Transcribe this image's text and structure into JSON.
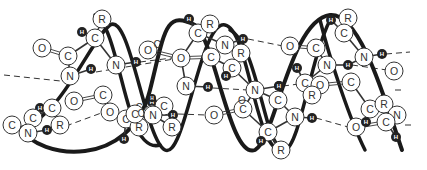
{
  "diagram": {
    "type": "alpha-helix-structure",
    "colors": {
      "background": "#ffffff",
      "backbone": "#1a1a1a",
      "atom_fill": "#ffffff",
      "atom_stroke": "#333333",
      "hydrogen_fill": "#222222",
      "hydrogen_text": "#ffffff",
      "bond": "#333333",
      "hbond": "#333333"
    },
    "backbone_paths": [
      "M 20 128 C 40 160, 130 170, 150 90 C 165 30, 165 10, 195 25 C 215 40, 230 160, 255 150 C 275 140, 290 20, 330 15 C 360 12, 385 100, 402 150",
      "M 20 128 C 60 120, 90 40, 110 25 C 130 12, 145 140, 165 150 C 185 160, 200 20, 225 25 C 250 30, 255 160, 285 150 C 300 145, 310 60, 330 20",
      "M 95 15 C 110 20, 120 80, 130 110 C 138 140, 150 148, 160 145",
      "M 230 30 C 250 40, 260 100, 270 130 C 275 145, 280 148, 285 150",
      "M 320 20 C 330 60, 350 120, 365 150"
    ],
    "atoms": [
      {
        "id": "o1",
        "label": "O",
        "x": 42,
        "y": 48,
        "r": 9
      },
      {
        "id": "c1",
        "label": "C",
        "x": 68,
        "y": 56,
        "r": 9
      },
      {
        "id": "n1",
        "label": "N",
        "x": 70,
        "y": 76,
        "r": 9
      },
      {
        "id": "h1",
        "label": "H",
        "x": 91,
        "y": 69,
        "r": 5,
        "hydrogen": true
      },
      {
        "id": "r1",
        "label": "R",
        "x": 102,
        "y": 19,
        "r": 9
      },
      {
        "id": "h2",
        "label": "H",
        "x": 82,
        "y": 32,
        "r": 5,
        "hydrogen": true
      },
      {
        "id": "c2",
        "label": "C",
        "x": 95,
        "y": 38,
        "r": 9
      },
      {
        "id": "n2",
        "label": "N",
        "x": 116,
        "y": 65,
        "r": 9
      },
      {
        "id": "h3",
        "label": "H",
        "x": 136,
        "y": 62,
        "r": 5,
        "hydrogen": true
      },
      {
        "id": "o2",
        "label": "O",
        "x": 148,
        "y": 50,
        "r": 9
      },
      {
        "id": "c3",
        "label": "C",
        "x": 157,
        "y": 44,
        "r": 0,
        "plain": true
      },
      {
        "id": "o3",
        "label": "O",
        "x": 181,
        "y": 58,
        "r": 9
      },
      {
        "id": "h4",
        "label": "H",
        "x": 189,
        "y": 19,
        "r": 5,
        "hydrogen": true
      },
      {
        "id": "c4",
        "label": "C",
        "x": 198,
        "y": 33,
        "r": 9
      },
      {
        "id": "r2",
        "label": "R",
        "x": 210,
        "y": 24,
        "r": 9
      },
      {
        "id": "n3",
        "label": "N",
        "x": 225,
        "y": 45,
        "r": 9
      },
      {
        "id": "h5",
        "label": "H",
        "x": 243,
        "y": 39,
        "r": 5,
        "hydrogen": true
      },
      {
        "id": "c5",
        "label": "C",
        "x": 211,
        "y": 57,
        "r": 9
      },
      {
        "id": "r3",
        "label": "R",
        "x": 241,
        "y": 53,
        "r": 9
      },
      {
        "id": "c6",
        "label": "C",
        "x": 232,
        "y": 68,
        "r": 9
      },
      {
        "id": "h6",
        "label": "H",
        "x": 226,
        "y": 76,
        "r": 5,
        "hydrogen": true
      },
      {
        "id": "n4",
        "label": "N",
        "x": 186,
        "y": 86,
        "r": 9
      },
      {
        "id": "h7",
        "label": "H",
        "x": 208,
        "y": 87,
        "r": 5,
        "hydrogen": true
      },
      {
        "id": "c7",
        "label": "C",
        "x": 12,
        "y": 125,
        "r": 9
      },
      {
        "id": "o4",
        "label": "O",
        "x": 74,
        "y": 101,
        "r": 9
      },
      {
        "id": "c8",
        "label": "C",
        "x": 103,
        "y": 95,
        "r": 9
      },
      {
        "id": "h8",
        "label": "H",
        "x": 40,
        "y": 108,
        "r": 5,
        "hydrogen": true
      },
      {
        "id": "c9",
        "label": "C",
        "x": 52,
        "y": 108,
        "r": 9
      },
      {
        "id": "c10",
        "label": "C",
        "x": 33,
        "y": 118,
        "r": 9
      },
      {
        "id": "n5",
        "label": "N",
        "x": 28,
        "y": 133,
        "r": 9
      },
      {
        "id": "h9",
        "label": "H",
        "x": 47,
        "y": 130,
        "r": 5,
        "hydrogen": true
      },
      {
        "id": "r4",
        "label": "R",
        "x": 60,
        "y": 125,
        "r": 9
      },
      {
        "id": "o5",
        "label": "O",
        "x": 110,
        "y": 112,
        "r": 9
      },
      {
        "id": "c11",
        "label": "C",
        "x": 126,
        "y": 119,
        "r": 9
      },
      {
        "id": "c12",
        "label": "C",
        "x": 139,
        "y": 107,
        "r": 0,
        "plain": true
      },
      {
        "id": "r5",
        "label": "R",
        "x": 139,
        "y": 127,
        "r": 9
      },
      {
        "id": "h10",
        "label": "H",
        "x": 124,
        "y": 139,
        "r": 5,
        "hydrogen": true
      },
      {
        "id": "h11",
        "label": "H",
        "x": 152,
        "y": 102,
        "r": 5,
        "hydrogen": true
      },
      {
        "id": "n6",
        "label": "N",
        "x": 152,
        "y": 114,
        "r": 9
      },
      {
        "id": "c13",
        "label": "C",
        "x": 135,
        "y": 114,
        "r": 9
      },
      {
        "id": "h12",
        "label": "H",
        "x": 152,
        "y": 98,
        "r": 4,
        "hydrogen": true
      },
      {
        "id": "c14",
        "label": "C",
        "x": 164,
        "y": 106,
        "r": 9
      },
      {
        "id": "c15",
        "label": "C",
        "x": 141,
        "y": 113,
        "r": 0,
        "plain": true
      },
      {
        "id": "n7",
        "label": "N",
        "x": 153,
        "y": 115,
        "r": 9
      },
      {
        "id": "h13",
        "label": "H",
        "x": 173,
        "y": 115,
        "r": 5,
        "hydrogen": true
      },
      {
        "id": "r6",
        "label": "R",
        "x": 172,
        "y": 127,
        "r": 9
      },
      {
        "id": "o6",
        "label": "O",
        "x": 214,
        "y": 115,
        "r": 9
      },
      {
        "id": "c16",
        "label": "C",
        "x": 243,
        "y": 109,
        "r": 9
      },
      {
        "id": "o7",
        "label": "O",
        "x": 242,
        "y": 100,
        "r": 0,
        "plain": true
      },
      {
        "id": "n8",
        "label": "N",
        "x": 255,
        "y": 90,
        "r": 9
      },
      {
        "id": "h14",
        "label": "H",
        "x": 279,
        "y": 86,
        "r": 5,
        "hydrogen": true
      },
      {
        "id": "c17",
        "label": "C",
        "x": 278,
        "y": 100,
        "r": 9
      },
      {
        "id": "c18",
        "label": "C",
        "x": 268,
        "y": 132,
        "r": 9
      },
      {
        "id": "h15",
        "label": "H",
        "x": 261,
        "y": 141,
        "r": 5,
        "hydrogen": true
      },
      {
        "id": "r7",
        "label": "R",
        "x": 281,
        "y": 150,
        "r": 9
      },
      {
        "id": "n9",
        "label": "N",
        "x": 295,
        "y": 117,
        "r": 9
      },
      {
        "id": "h16",
        "label": "H",
        "x": 312,
        "y": 118,
        "r": 5,
        "hydrogen": true
      },
      {
        "id": "o8",
        "label": "O",
        "x": 290,
        "y": 46,
        "r": 9
      },
      {
        "id": "c19",
        "label": "C",
        "x": 316,
        "y": 48,
        "r": 9
      },
      {
        "id": "h17",
        "label": "H",
        "x": 331,
        "y": 20,
        "r": 5,
        "hydrogen": true
      },
      {
        "id": "r8",
        "label": "R",
        "x": 348,
        "y": 18,
        "r": 9
      },
      {
        "id": "c20",
        "label": "C",
        "x": 344,
        "y": 33,
        "r": 9
      },
      {
        "id": "n10",
        "label": "N",
        "x": 327,
        "y": 65,
        "r": 9
      },
      {
        "id": "h18",
        "label": "H",
        "x": 348,
        "y": 65,
        "r": 5,
        "hydrogen": true
      },
      {
        "id": "n11",
        "label": "N",
        "x": 364,
        "y": 57,
        "r": 9
      },
      {
        "id": "h19",
        "label": "H",
        "x": 382,
        "y": 54,
        "r": 5,
        "hydrogen": true
      },
      {
        "id": "o9",
        "label": "O",
        "x": 394,
        "y": 71,
        "r": 9
      },
      {
        "id": "h20",
        "label": "H",
        "x": 297,
        "y": 68,
        "r": 5,
        "hydrogen": true
      },
      {
        "id": "c21",
        "label": "C",
        "x": 305,
        "y": 83,
        "r": 9
      },
      {
        "id": "o10",
        "label": "O",
        "x": 320,
        "y": 85,
        "r": 9
      },
      {
        "id": "r9",
        "label": "R",
        "x": 312,
        "y": 95,
        "r": 9
      },
      {
        "id": "c22",
        "label": "C",
        "x": 351,
        "y": 82,
        "r": 9
      },
      {
        "id": "h21",
        "label": "H",
        "x": 279,
        "y": 86,
        "r": 5,
        "hydrogen": true
      },
      {
        "id": "c23",
        "label": "C",
        "x": 370,
        "y": 109,
        "r": 9
      },
      {
        "id": "r10",
        "label": "R",
        "x": 384,
        "y": 104,
        "r": 9
      },
      {
        "id": "n12",
        "label": "N",
        "x": 397,
        "y": 115,
        "r": 9
      },
      {
        "id": "o11",
        "label": "O",
        "x": 356,
        "y": 127,
        "r": 9
      },
      {
        "id": "h22",
        "label": "H",
        "x": 366,
        "y": 122,
        "r": 5,
        "hydrogen": true
      },
      {
        "id": "c24",
        "label": "C",
        "x": 386,
        "y": 122,
        "r": 9
      },
      {
        "id": "h23",
        "label": "H",
        "x": 396,
        "y": 137,
        "r": 5,
        "hydrogen": true
      }
    ],
    "bonds": [
      [
        "o1",
        "c1",
        true
      ],
      [
        "c1",
        "n1",
        false
      ],
      [
        "n1",
        "h1",
        false
      ],
      [
        "c1",
        "c2",
        false
      ],
      [
        "c2",
        "r1",
        false
      ],
      [
        "c2",
        "h2",
        false
      ],
      [
        "c2",
        "n2",
        false
      ],
      [
        "n2",
        "h3",
        false
      ],
      [
        "o3",
        "c4",
        false
      ],
      [
        "c4",
        "h4",
        false
      ],
      [
        "c4",
        "r2",
        false
      ],
      [
        "c4",
        "n3",
        false
      ],
      [
        "n3",
        "h5",
        false
      ],
      [
        "o3",
        "c5",
        true
      ],
      [
        "c5",
        "n3",
        false
      ],
      [
        "c5",
        "c6",
        false
      ],
      [
        "c6",
        "r3",
        false
      ],
      [
        "c6",
        "h6",
        false
      ],
      [
        "c6",
        "n8",
        false
      ],
      [
        "n4",
        "h7",
        false
      ],
      [
        "o2",
        "o3",
        true
      ],
      [
        "n4",
        "o3",
        false
      ],
      [
        "o4",
        "c8",
        true
      ],
      [
        "c8",
        "o5",
        false
      ],
      [
        "o5",
        "c11",
        false
      ],
      [
        "c11",
        "r5",
        false
      ],
      [
        "c11",
        "h10",
        false
      ],
      [
        "c11",
        "n6",
        false
      ],
      [
        "n6",
        "h11",
        false
      ],
      [
        "c9",
        "c10",
        false
      ],
      [
        "c10",
        "n5",
        false
      ],
      [
        "n5",
        "h9",
        false
      ],
      [
        "h9",
        "r4",
        false
      ],
      [
        "c9",
        "r4",
        false
      ],
      [
        "c9",
        "h8",
        false
      ],
      [
        "c14",
        "n7",
        false
      ],
      [
        "n7",
        "r6",
        false
      ],
      [
        "n7",
        "h13",
        false
      ],
      [
        "o6",
        "c16",
        true
      ],
      [
        "c16",
        "n8",
        false
      ],
      [
        "c16",
        "c18",
        false
      ],
      [
        "c18",
        "h15",
        false
      ],
      [
        "c18",
        "r7",
        false
      ],
      [
        "c18",
        "n9",
        false
      ],
      [
        "n9",
        "h16",
        false
      ],
      [
        "n8",
        "h14",
        false
      ],
      [
        "c17",
        "n9",
        false
      ],
      [
        "c17",
        "n8",
        false
      ],
      [
        "o8",
        "c19",
        true
      ],
      [
        "c19",
        "n10",
        false
      ],
      [
        "n10",
        "h18",
        false
      ],
      [
        "h18",
        "n11",
        false
      ],
      [
        "c20",
        "r8",
        false
      ],
      [
        "c20",
        "h17",
        false
      ],
      [
        "c20",
        "n11",
        false
      ],
      [
        "n11",
        "h19",
        false
      ],
      [
        "c21",
        "h20",
        false
      ],
      [
        "c21",
        "r9",
        false
      ],
      [
        "c21",
        "n10",
        false
      ],
      [
        "o10",
        "c22",
        true
      ],
      [
        "c22",
        "c23",
        false
      ],
      [
        "c23",
        "r10",
        false
      ],
      [
        "r10",
        "n12",
        false
      ],
      [
        "o11",
        "c24",
        true
      ],
      [
        "c24",
        "n12",
        false
      ],
      [
        "c24",
        "h23",
        false
      ],
      [
        "o11",
        "h22",
        false
      ]
    ],
    "hydrogen_bonds": [
      [
        4,
        75,
        70,
        82
      ],
      [
        96,
        72,
        180,
        58
      ],
      [
        140,
        62,
        172,
        58
      ],
      [
        248,
        39,
        283,
        46
      ],
      [
        213,
        88,
        248,
        90
      ],
      [
        66,
        126,
        104,
        112
      ],
      [
        178,
        114,
        206,
        115
      ],
      [
        283,
        86,
        315,
        82
      ],
      [
        316,
        118,
        348,
        127
      ],
      [
        352,
        65,
        394,
        71
      ],
      [
        386,
        54,
        410,
        52
      ],
      [
        395,
        90,
        405,
        90
      ],
      [
        405,
        125,
        415,
        125
      ]
    ],
    "atom_labels": {
      "carbon": "C",
      "nitrogen": "N",
      "oxygen": "O",
      "side_chain": "R",
      "hydrogen": "H"
    }
  }
}
